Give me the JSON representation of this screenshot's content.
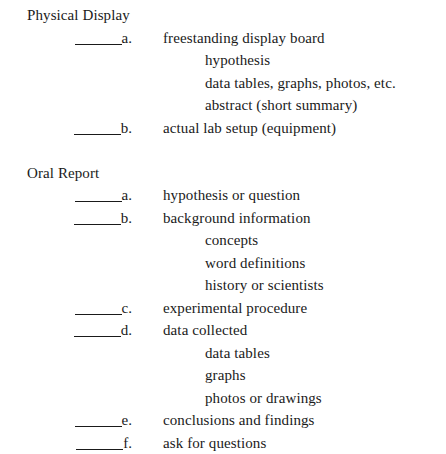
{
  "document": {
    "background_color": "#ffffff",
    "text_color": "#1a1a1a",
    "sections": [
      {
        "title": "Physical Display",
        "items": [
          {
            "letter": "a.",
            "text": "freestanding display board",
            "subitems": [
              "hypothesis",
              "data tables, graphs, photos, etc.",
              "abstract (short summary)"
            ]
          },
          {
            "letter": "b.",
            "text": "actual lab setup (equipment)",
            "subitems": []
          }
        ]
      },
      {
        "title": "Oral Report",
        "items": [
          {
            "letter": "a.",
            "text": "hypothesis or question",
            "subitems": []
          },
          {
            "letter": "b.",
            "text": "background information",
            "subitems": [
              "concepts",
              "word definitions",
              "history or scientists"
            ]
          },
          {
            "letter": "c.",
            "text": "experimental procedure",
            "subitems": []
          },
          {
            "letter": "d.",
            "text": "data collected",
            "subitems": [
              "data tables",
              "graphs",
              "photos or drawings"
            ]
          },
          {
            "letter": "e.",
            "text": "conclusions and findings",
            "subitems": []
          },
          {
            "letter": "f.",
            "text": "ask for questions",
            "subitems": []
          }
        ]
      }
    ]
  }
}
